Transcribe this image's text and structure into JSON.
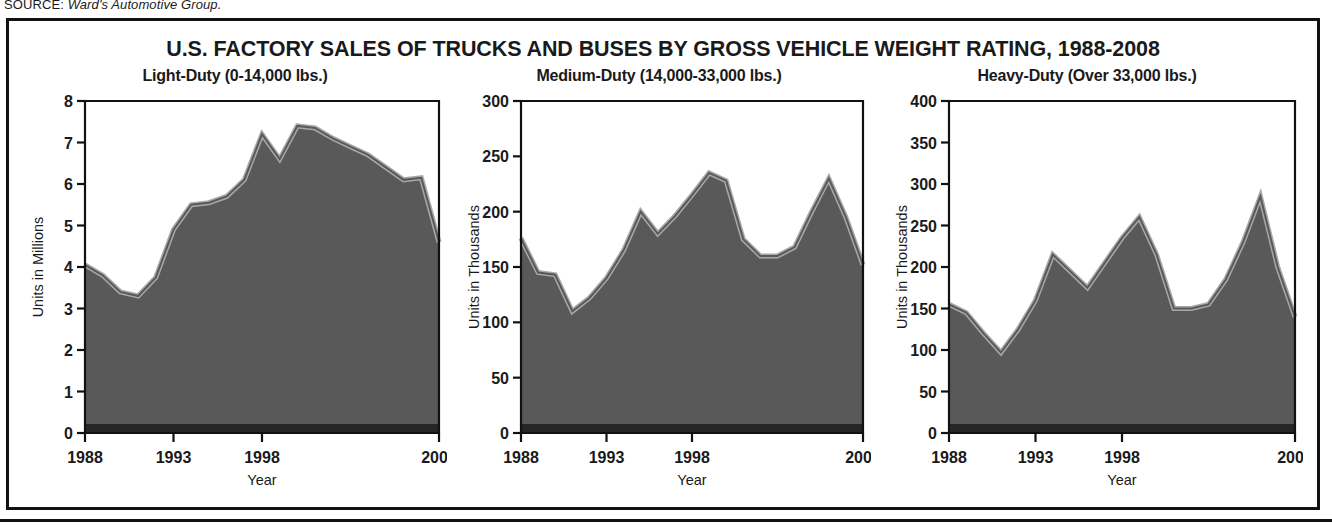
{
  "source": {
    "label": "SOURCE:",
    "value": "Ward's Automotive Group."
  },
  "figure": {
    "title": "U.S. FACTORY SALES OF TRUCKS AND BUSES BY GROSS VEHICLE WEIGHT RATING, 1988-2008",
    "colors": {
      "fill": "#595959",
      "highlight": "#a8a8a8",
      "base_strip": "#262626",
      "axis": "#111111",
      "border": "#111111",
      "background": "#ffffff",
      "text": "#1a1a1a"
    }
  },
  "chart_data": [
    {
      "type": "area",
      "title": "Light-Duty (0-14,000 lbs.)",
      "xlabel": "Year",
      "ylabel": "Units in Millions",
      "units": "millions",
      "xlim": [
        1988,
        2008
      ],
      "ylim": [
        0,
        8
      ],
      "yticks": [
        0,
        1,
        2,
        3,
        4,
        5,
        6,
        7,
        8
      ],
      "ytick_labels": [
        "0",
        "1",
        "2",
        "3",
        "4",
        "5",
        "6",
        "7",
        "8"
      ],
      "xticks": [
        1988,
        1993,
        1998,
        2008
      ],
      "xtick_labels": [
        "1988",
        "1993",
        "1998",
        "2008"
      ],
      "grid": false,
      "legend": "none",
      "x": [
        1988,
        1989,
        1990,
        1991,
        1992,
        1993,
        1994,
        1995,
        1996,
        1997,
        1998,
        1999,
        2000,
        2001,
        2002,
        2003,
        2004,
        2005,
        2006,
        2007,
        2008
      ],
      "values": [
        4.05,
        3.8,
        3.4,
        3.3,
        3.75,
        4.9,
        5.5,
        5.55,
        5.7,
        6.1,
        7.2,
        6.6,
        7.4,
        7.35,
        7.1,
        6.9,
        6.7,
        6.4,
        6.1,
        6.15,
        4.6
      ]
    },
    {
      "type": "area",
      "title": "Medium-Duty (14,000-33,000 lbs.)",
      "xlabel": "Year",
      "ylabel": "Units in Thousands",
      "units": "thousands",
      "xlim": [
        1988,
        2008
      ],
      "ylim": [
        0,
        300
      ],
      "yticks": [
        0,
        50,
        100,
        150,
        200,
        250,
        300
      ],
      "ytick_labels": [
        "0",
        "50",
        "100",
        "150",
        "200",
        "250",
        "300"
      ],
      "xticks": [
        1988,
        1993,
        1998,
        2008
      ],
      "xtick_labels": [
        "1988",
        "1993",
        "1998",
        "2008"
      ],
      "grid": false,
      "legend": "none",
      "x": [
        1988,
        1989,
        1990,
        1991,
        1992,
        1993,
        1994,
        1995,
        1996,
        1997,
        1998,
        1999,
        2000,
        2001,
        2002,
        2003,
        2004,
        2005,
        2006,
        2007,
        2008
      ],
      "values": [
        176,
        145,
        143,
        110,
        122,
        140,
        165,
        200,
        180,
        196,
        215,
        235,
        228,
        175,
        160,
        160,
        168,
        200,
        230,
        195,
        152
      ]
    },
    {
      "type": "area",
      "title": "Heavy-Duty (Over 33,000 lbs.)",
      "xlabel": "Year",
      "ylabel": "Units in Thousands",
      "units": "thousands",
      "xlim": [
        1988,
        2008
      ],
      "ylim": [
        0,
        400
      ],
      "yticks": [
        0,
        50,
        100,
        150,
        200,
        250,
        300,
        350,
        400
      ],
      "ytick_labels": [
        "0",
        "50",
        "100",
        "150",
        "200",
        "250",
        "300",
        "350",
        "400"
      ],
      "xticks": [
        1988,
        1993,
        1998,
        2008
      ],
      "xtick_labels": [
        "1988",
        "1993",
        "1998",
        "2008"
      ],
      "grid": false,
      "legend": "none",
      "x": [
        1988,
        1989,
        1990,
        1991,
        1992,
        1993,
        1994,
        1995,
        1996,
        1997,
        1998,
        1999,
        2000,
        2001,
        2002,
        2003,
        2004,
        2005,
        2006,
        2007,
        2008
      ],
      "values": [
        155,
        145,
        120,
        97,
        125,
        160,
        215,
        195,
        175,
        205,
        235,
        260,
        215,
        150,
        150,
        155,
        185,
        230,
        285,
        200,
        140
      ]
    }
  ]
}
